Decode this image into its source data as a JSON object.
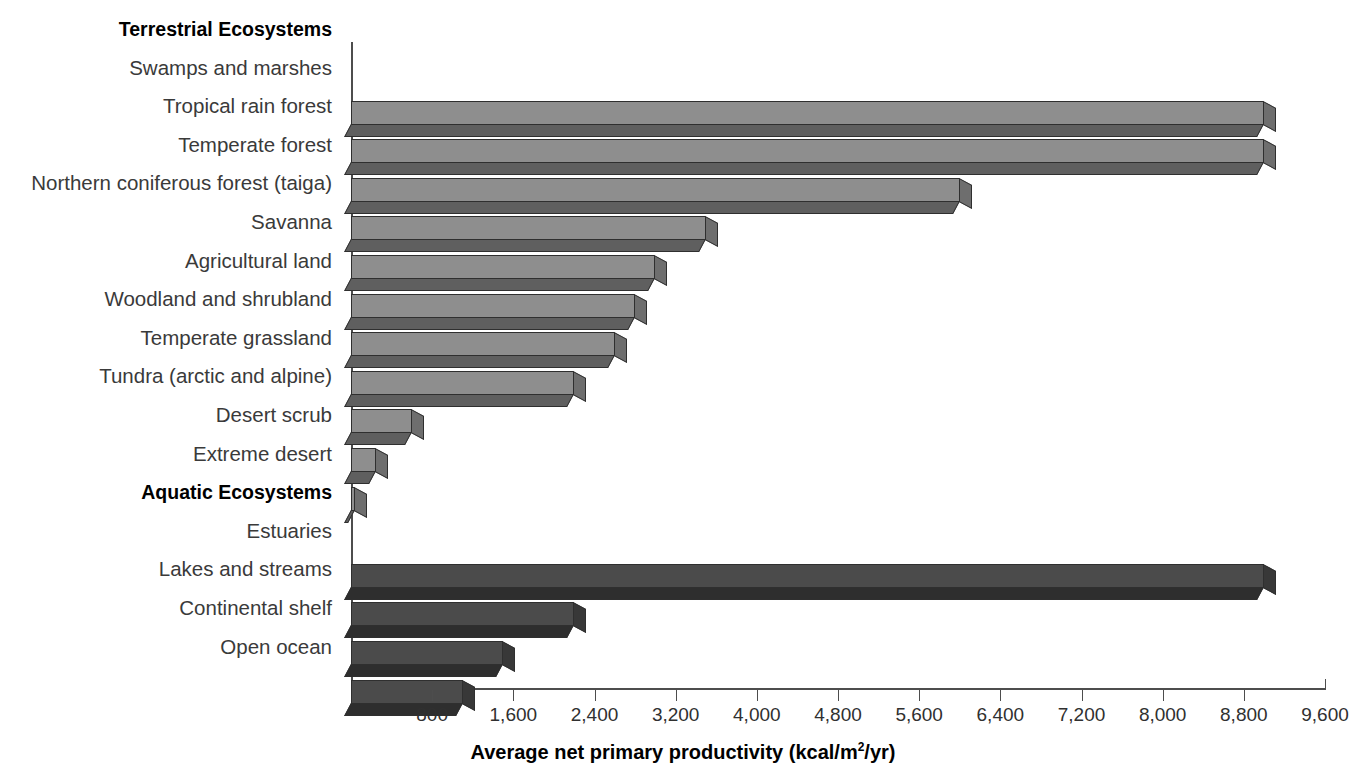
{
  "chart_data": {
    "type": "bar",
    "orientation": "horizontal",
    "title": "",
    "xlabel": "Average net primary productivity (kcal/m2/yr)",
    "xlabel_parts": {
      "main": "Average net primary productivity (kcal/m",
      "sup": "2",
      "tail": "/yr)"
    },
    "ylabel": "",
    "xlim": [
      0,
      9600
    ],
    "grid": false,
    "legend": false,
    "tick_labels": [
      "800",
      "1,600",
      "2,400",
      "3,200",
      "4,000",
      "4,800",
      "5,600",
      "6,400",
      "7,200",
      "8,000",
      "8,800",
      "9,600"
    ],
    "tick_values": [
      800,
      1600,
      2400,
      3200,
      4000,
      4800,
      5600,
      6400,
      7200,
      8000,
      8800,
      9600
    ],
    "groups": [
      {
        "name": "Terrestrial Ecosystems",
        "style": "terrestrial",
        "color": "#8e8e8e",
        "categories": [
          "Swamps and marshes",
          "Tropical rain forest",
          "Temperate forest",
          "Northern coniferous forest (taiga)",
          "Savanna",
          "Agricultural land",
          "Woodland and shrubland",
          "Temperate grassland",
          "Tundra (arctic and alpine)",
          "Desert scrub",
          "Extreme desert"
        ],
        "values": [
          9000,
          9000,
          6000,
          3500,
          3000,
          2800,
          2600,
          2200,
          600,
          250,
          40
        ]
      },
      {
        "name": "Aquatic Ecosystems",
        "style": "aquatic",
        "color": "#4b4b4b",
        "categories": [
          "Estuaries",
          "Lakes and streams",
          "Continental shelf",
          "Open ocean"
        ],
        "values": [
          9000,
          2200,
          1500,
          1100
        ]
      }
    ]
  }
}
